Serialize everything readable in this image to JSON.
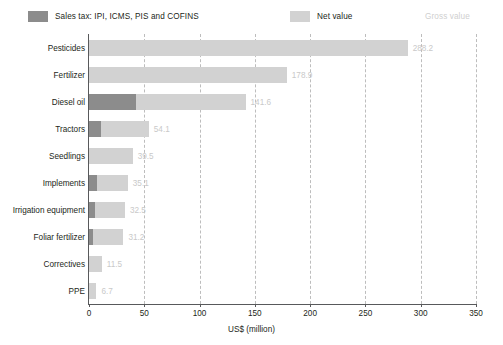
{
  "chart_data": {
    "type": "bar",
    "orientation": "horizontal",
    "stacked": true,
    "title": "",
    "xlabel": "US$ (million)",
    "ylabel": "",
    "xlim": [
      0,
      350
    ],
    "xticks": [
      0,
      50,
      100,
      150,
      200,
      250,
      300,
      350
    ],
    "grid": "vertical-dashed",
    "legend_position": "top",
    "categories": [
      "Pesticides",
      "Fertilizer",
      "Diesel oil",
      "Tractors",
      "Seedlings",
      "Implements",
      "Irrigation equipment",
      "Foliar fertilizer",
      "Correctives",
      "PPE"
    ],
    "series": [
      {
        "name": "Sales tax: IPI, ICMS, PIS and COFINS",
        "color": "#8c8c8c",
        "values": [
          0,
          0,
          42.5,
          10.5,
          0,
          7.5,
          5.5,
          3.5,
          0,
          0
        ]
      },
      {
        "name": "Net value",
        "color": "#d2d2d2",
        "values": [
          288.2,
          178.9,
          99.1,
          43.6,
          39.5,
          27.6,
          27.0,
          27.7,
          11.5,
          6.7
        ]
      }
    ],
    "gross_values": [
      288.2,
      178.9,
      141.6,
      54.1,
      39.5,
      35.1,
      32.5,
      31.2,
      11.5,
      6.7
    ],
    "value_labels": [
      "288.2",
      "178.9",
      "141.6",
      "54.1",
      "39.5",
      "35.1",
      "32.5",
      "31.2",
      "11.5",
      "6.7"
    ],
    "value_label_color": "#c9c9c9"
  },
  "legend": {
    "tax": {
      "label": "Sales tax: IPI, ICMS, PIS and COFINS",
      "color": "#8c8c8c"
    },
    "net": {
      "label": "Net value",
      "color": "#d2d2d2"
    },
    "gross": {
      "label": "Gross value",
      "color": "#cfcfcf"
    }
  },
  "axis": {
    "x_title": "US$ (million)",
    "x_tick_labels": [
      "0",
      "50",
      "100",
      "150",
      "200",
      "250",
      "300",
      "350"
    ]
  }
}
